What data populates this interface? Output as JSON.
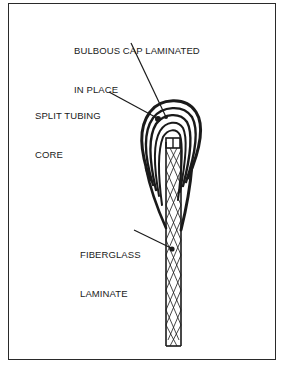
{
  "figure": {
    "type": "technical illustration",
    "labels": [
      {
        "id": "cap",
        "lines": [
          "BULBOUS CAP LAMINATED",
          "IN PLACE"
        ]
      },
      {
        "id": "core",
        "lines": [
          "SPLIT TUBING",
          "CORE"
        ]
      },
      {
        "id": "laminate",
        "lines": [
          "FIBERGLASS",
          "LAMINATE"
        ]
      }
    ],
    "colors": {
      "ink": "#1a1a1a",
      "background": "#ffffff"
    }
  }
}
